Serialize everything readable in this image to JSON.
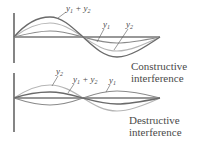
{
  "panels": [
    {
      "name": "constructive",
      "caption_line1": "Constructive",
      "caption_line2": "interference",
      "labels": {
        "sum": "y1 + y2",
        "y1": "y1",
        "y2": "y2"
      }
    },
    {
      "name": "destructive",
      "caption_line1": "Destructive",
      "caption_line2": "interference",
      "labels": {
        "sum": "y1 + y2",
        "y1": "y1",
        "y2": "y2"
      }
    }
  ],
  "colors": {
    "axis": "#333333",
    "y1": "#8a8a8a",
    "y2": "#b5b5b5",
    "sum": "#6a6a6a",
    "text": "#4a4a4a"
  }
}
